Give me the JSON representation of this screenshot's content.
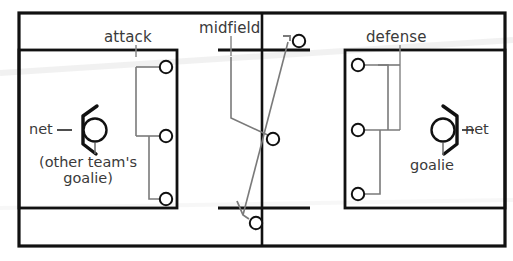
{
  "diagram": {
    "colors": {
      "background": "#ffffff",
      "field_line": "#111111",
      "player_line": "#6b6b6b",
      "text": "#3a3a3a",
      "net": "#111111"
    },
    "labels": {
      "attack": "attack",
      "midfield": "midfield",
      "defense": "defense",
      "net_left": "net",
      "net_right": "net",
      "goalie_right": "goalie",
      "other_goalie_line1": "(other team's",
      "other_goalie_line2": "goalie)"
    },
    "zones": [
      {
        "name": "attack",
        "side": "left",
        "players": 3
      },
      {
        "name": "midfield",
        "side": "center",
        "players": 3
      },
      {
        "name": "defense",
        "side": "right",
        "players": 3
      }
    ],
    "goalies": [
      {
        "side": "left",
        "label": "other team's goalie",
        "net_label": "net"
      },
      {
        "side": "right",
        "label": "goalie",
        "net_label": "net"
      }
    ]
  }
}
